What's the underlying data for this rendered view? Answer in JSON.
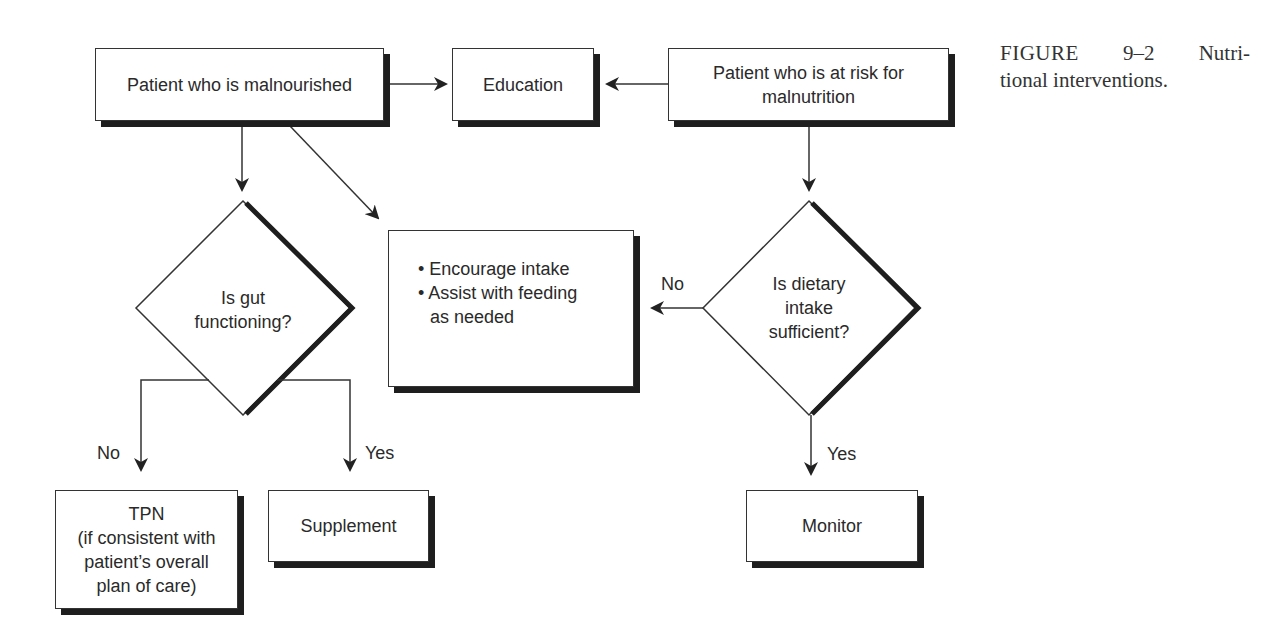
{
  "caption": {
    "figure_label": "FIGURE",
    "figure_number": "9–2",
    "text_line1_tail": "Nutri-",
    "text_line2": "tional interventions."
  },
  "nodes": {
    "malnourished": "Patient who is malnourished",
    "education": "Education",
    "at_risk_line1": "Patient who is at risk for",
    "at_risk_line2": "malnutrition",
    "gut_line1": "Is gut",
    "gut_line2": "functioning?",
    "intake_bullets": [
      "• Encourage intake",
      "• Assist with feeding",
      "as needed"
    ],
    "dietary_line1": "Is dietary",
    "dietary_line2": "intake",
    "dietary_line3": "sufficient?",
    "tpn_line1": "TPN",
    "tpn_line2": "(if consistent with",
    "tpn_line3": "patient’s overall",
    "tpn_line4": "plan of care)",
    "supplement": "Supplement",
    "monitor": "Monitor"
  },
  "edge_labels": {
    "gut_no": "No",
    "gut_yes": "Yes",
    "dietary_no": "No",
    "dietary_yes": "Yes"
  },
  "colors": {
    "line": "#333333",
    "shadow": "#1e1e1e",
    "text": "#2a2a2a"
  }
}
